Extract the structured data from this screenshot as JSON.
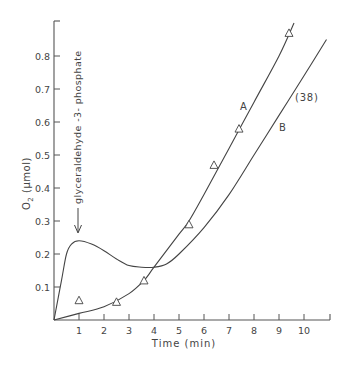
{
  "chart_data": {
    "type": "line",
    "title": "",
    "xlabel": "Time (min)",
    "ylabel": "O2 (µmol)",
    "xlim": [
      0,
      11
    ],
    "ylim": [
      0,
      0.9
    ],
    "x_ticks": [
      1,
      2,
      3,
      4,
      5,
      6,
      7,
      8,
      9,
      10
    ],
    "x_tick_labels": [
      "1",
      "2",
      "3",
      "4",
      "5",
      "6",
      "7",
      "8",
      "9",
      "10"
    ],
    "y_ticks": [
      0.1,
      0.2,
      0.3,
      0.4,
      0.5,
      0.6,
      0.7,
      0.8
    ],
    "y_tick_labels": [
      "0.1",
      "0.2",
      "0.3",
      "0.4",
      "0.5",
      "0.6",
      "0.7",
      "0.8"
    ],
    "grid": false,
    "legend": "none (curves labeled inline)",
    "series": [
      {
        "name": "A",
        "style": "line",
        "x": [
          0,
          1,
          2,
          3,
          3.6,
          4,
          5,
          5.4,
          6,
          7,
          8,
          9,
          9.6
        ],
        "y": [
          0,
          0.02,
          0.04,
          0.08,
          0.12,
          0.16,
          0.26,
          0.3,
          0.38,
          0.52,
          0.66,
          0.8,
          0.9
        ]
      },
      {
        "name": "B",
        "style": "line",
        "x": [
          0,
          0.3,
          0.5,
          0.7,
          1,
          1.5,
          2,
          2.5,
          3,
          3.5,
          4,
          4.5,
          5,
          6,
          7,
          8,
          9,
          10,
          10.9
        ],
        "y": [
          0,
          0.12,
          0.2,
          0.23,
          0.24,
          0.23,
          0.21,
          0.185,
          0.165,
          0.16,
          0.16,
          0.17,
          0.2,
          0.28,
          0.38,
          0.5,
          0.62,
          0.74,
          0.85
        ]
      },
      {
        "name": "Δ measured points",
        "style": "marker-triangle",
        "x": [
          1,
          2.5,
          3.6,
          5.4,
          6.4,
          7.4,
          9.4
        ],
        "y": [
          0.06,
          0.055,
          0.12,
          0.29,
          0.47,
          0.58,
          0.87
        ]
      }
    ],
    "annotations": [
      {
        "text": "glyceraldehyde -3- phosphate",
        "x": 1,
        "y": 0.25,
        "type": "vertical-arrow-down"
      },
      {
        "text": "A",
        "x": 7.5,
        "y": 0.65
      },
      {
        "text": "B",
        "x": 9.1,
        "y": 0.59
      },
      {
        "text": "(38)",
        "x": 9.6,
        "y": 0.67
      }
    ]
  },
  "labels": {
    "xlabel": "Time (min)",
    "ylabel_main": "O",
    "ylabel_sub": "2",
    "ylabel_unit": " (µmol)",
    "arrow_annotation": "glyceraldehyde -3- phosphate",
    "curve_a": "A",
    "curve_b": "B",
    "ref": "(38)"
  }
}
